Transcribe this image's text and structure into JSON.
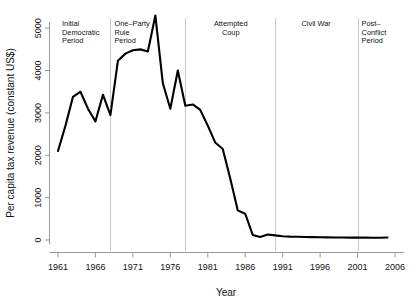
{
  "chart_data": {
    "type": "line",
    "title": "",
    "xlabel": "Year",
    "ylabel": "Per capita tax revenue (constant US$)",
    "xlim": [
      1961,
      2006
    ],
    "ylim": [
      0,
      5400
    ],
    "xticks": [
      1961,
      1966,
      1971,
      1976,
      1981,
      1986,
      1991,
      1996,
      2001,
      2006
    ],
    "yticks": [
      0,
      1000,
      2000,
      3000,
      4000,
      5000
    ],
    "grid": false,
    "legend": "none",
    "x": [
      1961,
      1962,
      1963,
      1964,
      1965,
      1966,
      1967,
      1968,
      1969,
      1970,
      1971,
      1972,
      1973,
      1974,
      1975,
      1976,
      1977,
      1978,
      1979,
      1980,
      1981,
      1982,
      1983,
      1984,
      1985,
      1986,
      1987,
      1988,
      1989,
      1990,
      1991,
      1992,
      1993,
      1994,
      1995,
      1996,
      1997,
      1998,
      1999,
      2000,
      2001,
      2002,
      2003,
      2004,
      2005
    ],
    "values": [
      2100,
      2700,
      3380,
      3500,
      3100,
      2800,
      3430,
      2950,
      4230,
      4400,
      4480,
      4500,
      4450,
      5300,
      3700,
      3100,
      4000,
      3170,
      3200,
      3070,
      2700,
      2300,
      2150,
      1450,
      700,
      620,
      120,
      70,
      130,
      110,
      90,
      80,
      75,
      70,
      68,
      65,
      62,
      60,
      58,
      57,
      56,
      55,
      54,
      53,
      60
    ],
    "series_name": "Per capita tax revenue",
    "line_color": "#000000",
    "periods": [
      {
        "label": "Initial\nDemocratic\nPeriod",
        "start": 1961,
        "end": 1968
      },
      {
        "label": "One–Party\nRule\nPeriod",
        "start": 1968,
        "end": 1978
      },
      {
        "label": "Attempted\nCoup",
        "start": 1978,
        "end": 1990
      },
      {
        "label": "Civil War",
        "start": 1990,
        "end": 2001
      },
      {
        "label": "Post–\nConflict\nPeriod",
        "start": 2001,
        "end": 2006
      }
    ],
    "divider_years": [
      1968,
      1978,
      1990,
      2001
    ],
    "divider_color": "#c8c8c8",
    "axis_color": "#999999"
  }
}
